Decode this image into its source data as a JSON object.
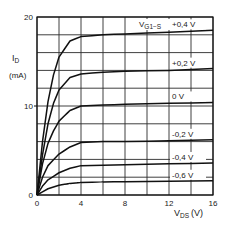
{
  "chart_data": {
    "type": "line",
    "title": "",
    "xlabel": "V_DS (V)",
    "ylabel": "I_D (mA)",
    "xlabel_main": "V",
    "xlabel_sub": "DS",
    "xlabel_unit": "(V)",
    "ylabel_main": "I",
    "ylabel_sub": "D",
    "ylabel_unit": "(mA)",
    "xlim": [
      0,
      16
    ],
    "ylim": [
      0,
      20
    ],
    "x_ticks": [
      0,
      4,
      8,
      12,
      16
    ],
    "y_ticks": [
      0,
      10,
      20
    ],
    "grid": true,
    "grid_x_step": 2,
    "grid_y_step": 2,
    "legend_title_main": "V",
    "legend_title_sub": "G1−S",
    "legend_position": "right, inline labels",
    "series": [
      {
        "name": "+0,4 V",
        "x": [
          0,
          0.5,
          1,
          1.5,
          2,
          3,
          4,
          6,
          8,
          12,
          16
        ],
        "values": [
          0,
          6,
          10.5,
          13.5,
          15.5,
          17.3,
          17.8,
          18.0,
          18.1,
          18.3,
          18.5
        ]
      },
      {
        "name": "+0,2 V",
        "x": [
          0,
          0.5,
          1,
          1.5,
          2,
          3,
          4,
          6,
          8,
          12,
          16
        ],
        "values": [
          0,
          4.5,
          8,
          10.3,
          11.8,
          13.2,
          13.6,
          13.8,
          13.9,
          14.0,
          14.2
        ]
      },
      {
        "name": "0 V",
        "x": [
          0,
          0.5,
          1,
          1.5,
          2,
          3,
          4,
          6,
          8,
          12,
          16
        ],
        "values": [
          0,
          3.5,
          5.8,
          7.2,
          8.3,
          9.5,
          10.0,
          10.1,
          10.2,
          10.3,
          10.4
        ]
      },
      {
        "name": "-0,2 V",
        "x": [
          0,
          0.5,
          1,
          2,
          3,
          4,
          6,
          8,
          12,
          16
        ],
        "values": [
          0,
          2.0,
          3.3,
          4.6,
          5.4,
          5.9,
          6.0,
          6.0,
          6.1,
          6.2
        ]
      },
      {
        "name": "-0,4 V",
        "x": [
          0,
          0.5,
          1,
          2,
          3,
          4,
          6,
          8,
          12,
          16
        ],
        "values": [
          0,
          1.0,
          1.7,
          2.5,
          3.0,
          3.3,
          3.35,
          3.4,
          3.5,
          3.6
        ]
      },
      {
        "name": "-0,6 V",
        "x": [
          0,
          1,
          2,
          3,
          4,
          6,
          8,
          12,
          16
        ],
        "values": [
          0,
          0.7,
          1.1,
          1.3,
          1.4,
          1.45,
          1.5,
          1.55,
          1.6
        ]
      }
    ]
  }
}
